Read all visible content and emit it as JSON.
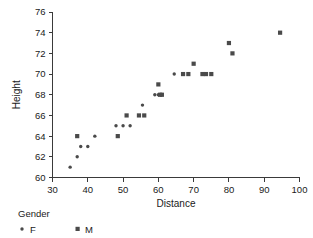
{
  "chart_data": {
    "type": "scatter",
    "title": "",
    "xlabel": "Distance",
    "ylabel": "Height",
    "xlim": [
      30,
      100
    ],
    "ylim": [
      60,
      76
    ],
    "xticks": [
      30,
      40,
      50,
      60,
      70,
      80,
      90,
      100
    ],
    "yticks": [
      60,
      62,
      64,
      66,
      68,
      70,
      72,
      74,
      76
    ],
    "grid": false,
    "legend": {
      "title": "Gender",
      "position": "bottom-left",
      "entries": [
        {
          "name": "F",
          "marker": "dot",
          "color": "#4a4a4a"
        },
        {
          "name": "M",
          "marker": "square",
          "color": "#4a4a4a"
        }
      ]
    },
    "series": [
      {
        "name": "F",
        "marker": "dot",
        "color": "#4a4a4a",
        "points": [
          [
            35,
            61
          ],
          [
            37,
            62
          ],
          [
            38,
            63
          ],
          [
            40,
            63
          ],
          [
            42,
            64
          ],
          [
            48,
            65
          ],
          [
            50,
            65
          ],
          [
            52,
            65
          ],
          [
            55.5,
            67
          ],
          [
            59,
            68
          ],
          [
            60,
            68
          ],
          [
            64.5,
            70
          ]
        ]
      },
      {
        "name": "M",
        "marker": "square",
        "color": "#4a4a4a",
        "points": [
          [
            37,
            64
          ],
          [
            48.5,
            64
          ],
          [
            51,
            66
          ],
          [
            54.5,
            66
          ],
          [
            56,
            66
          ],
          [
            60,
            69
          ],
          [
            60.5,
            68
          ],
          [
            61,
            68
          ],
          [
            67,
            70
          ],
          [
            68.5,
            70
          ],
          [
            70,
            71
          ],
          [
            72.5,
            70
          ],
          [
            73.5,
            70
          ],
          [
            75,
            70
          ],
          [
            80,
            73
          ],
          [
            81,
            72
          ],
          [
            94.5,
            74
          ]
        ]
      }
    ]
  }
}
